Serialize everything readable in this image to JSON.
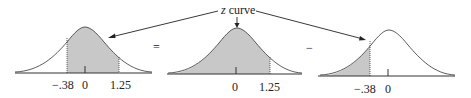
{
  "diagram": {
    "label": {
      "italic": "z",
      "rest": " curve"
    },
    "operators": [
      "=",
      "−"
    ],
    "colors": {
      "shade": "#c8c8c8",
      "line": "#333333",
      "text": "#222222"
    },
    "panels": [
      {
        "name": "area-between",
        "shaded_from": -0.38,
        "shaded_to": 1.25,
        "tick_labels": [
          "−.38",
          "0",
          "1.25"
        ]
      },
      {
        "name": "area-left-of-1.25",
        "shaded_from": "-inf",
        "shaded_to": 1.25,
        "tick_labels": [
          "0",
          "1.25"
        ]
      },
      {
        "name": "area-left-of-neg-0.38",
        "shaded_from": "-inf",
        "shaded_to": -0.38,
        "tick_labels": [
          "−.38",
          "0"
        ]
      }
    ]
  }
}
